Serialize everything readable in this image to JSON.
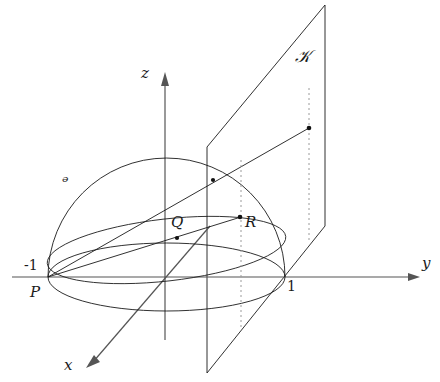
{
  "figure": {
    "canvas": {
      "width": 440,
      "height": 382,
      "background": "#ffffff"
    },
    "stroke_color": "#1a1a1a",
    "axis_color": "#555555",
    "dotted_color": "#999999",
    "axes": [
      {
        "id": "y-axis",
        "label": "y",
        "label_x": 422,
        "label_y": 256,
        "arrow_tip_x": 420,
        "arrow_tip_y": 277
      },
      {
        "id": "z-axis",
        "label": "z",
        "label_x": 141,
        "label_y": 66,
        "arrow_tip_x": 165,
        "arrow_tip_y": 72
      },
      {
        "id": "x-axis",
        "label": "x",
        "label_x": 64,
        "label_y": 358,
        "arrow_tip_x": 86,
        "arrow_tip_y": 368
      }
    ],
    "axis_ticks": [
      {
        "id": "tick-minus-one",
        "text": "-1",
        "x": 24,
        "y": 258
      },
      {
        "id": "tick-one",
        "text": "1",
        "x": 287,
        "y": 279
      }
    ],
    "set_labels": [
      {
        "id": "label-U",
        "text": "ᵊ",
        "x": 62,
        "y": 174,
        "meaning": "hemisphere-surface-U"
      },
      {
        "id": "label-K",
        "text": "𝒦",
        "x": 295,
        "y": 48,
        "meaning": "projection-plane-K"
      }
    ],
    "points": [
      {
        "id": "point-P",
        "label": "P",
        "label_x": 30,
        "label_y": 285,
        "cx": 48,
        "cy": 277,
        "dot": false
      },
      {
        "id": "point-Q",
        "label": "Q",
        "label_x": 171,
        "label_y": 215,
        "cx": 177,
        "cy": 238,
        "dot": true
      },
      {
        "id": "point-R",
        "label": "R",
        "label_x": 245,
        "label_y": 215,
        "cx": 240,
        "cy": 217,
        "dot": true
      },
      {
        "id": "point-on-sphere",
        "label": "",
        "label_x": 0,
        "label_y": 0,
        "cx": 213,
        "cy": 180,
        "dot": true
      },
      {
        "id": "point-on-plane",
        "label": "",
        "label_x": 0,
        "label_y": 0,
        "cx": 309,
        "cy": 128,
        "dot": true
      }
    ],
    "geometry_notes": {
      "origin_x": 165,
      "origin_y": 277,
      "sphere_radius_px": 118,
      "base_ellipse_ry": 34,
      "plane_left_x": 207,
      "plane_right_x": 325,
      "plane_top_right_y": 5,
      "plane_bottom_left_y": 373
    }
  }
}
